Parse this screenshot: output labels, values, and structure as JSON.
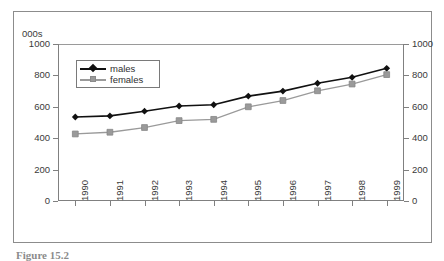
{
  "figure": {
    "units_label": "000s",
    "caption_prefix": "Figure 15.2",
    "caption_rest": ""
  },
  "legend": {
    "position": "inside-top-left",
    "entries": [
      {
        "label": "males",
        "marker": "diamond",
        "color": "#111111"
      },
      {
        "label": "females",
        "marker": "square",
        "color": "#9a9a9a"
      }
    ]
  },
  "axes": {
    "y_left_ticks": [
      "1000",
      "800",
      "600",
      "400",
      "200",
      "0"
    ],
    "y_right_ticks": [
      "1000",
      "800",
      "600",
      "400",
      "200",
      "0"
    ],
    "x_ticks": [
      "1990",
      "1991",
      "1992",
      "1993",
      "1994",
      "1995",
      "1996",
      "1997",
      "1998",
      "1999"
    ]
  },
  "chart_data": {
    "type": "line",
    "title": "",
    "subtitle": "",
    "xlabel": "",
    "ylabel": "000s",
    "x": [
      "1990",
      "1991",
      "1992",
      "1993",
      "1994",
      "1995",
      "1996",
      "1997",
      "1998",
      "1999"
    ],
    "categories": [
      "1990",
      "1991",
      "1992",
      "1993",
      "1994",
      "1995",
      "1996",
      "1997",
      "1998",
      "1999"
    ],
    "series": [
      {
        "name": "males",
        "color": "#111111",
        "marker": "diamond",
        "values": [
          535,
          542,
          572,
          605,
          613,
          668,
          700,
          750,
          788,
          845
        ]
      },
      {
        "name": "females",
        "color": "#9a9a9a",
        "marker": "square",
        "values": [
          427,
          438,
          468,
          512,
          520,
          600,
          640,
          702,
          745,
          805
        ]
      }
    ],
    "ylim": [
      0,
      1000
    ],
    "ytick_values": [
      0,
      200,
      400,
      600,
      800,
      1000
    ],
    "grid": false,
    "dual_y_axis": true,
    "legend_position": "upper left"
  }
}
